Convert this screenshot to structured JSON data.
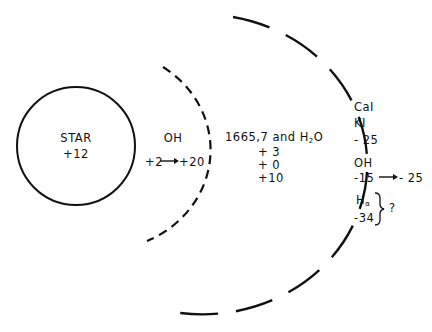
{
  "star": {
    "title": "STAR",
    "velocity": "+12"
  },
  "inner_shell": {
    "species": "OH",
    "velocity_from": "+2",
    "arrow": "→",
    "velocity_to": "+20"
  },
  "middle_region": {
    "species_line_prefix": "1665,7 and H",
    "species_line_sub": "2",
    "species_line_suffix": "O",
    "velocities": [
      "+ 3",
      "+ 0",
      "+10"
    ]
  },
  "outer_shell": {
    "ca_label": "CaI",
    "k_label": "KI",
    "ca_k_velocity": "- 25",
    "oh_label": "OH",
    "oh_velocity_from": "-15",
    "oh_arrow": "→",
    "oh_velocity_to": "- 25",
    "halpha_label": "H",
    "halpha_sub": "α",
    "halpha_velocity": "-34",
    "brace": "}",
    "question": "?"
  }
}
